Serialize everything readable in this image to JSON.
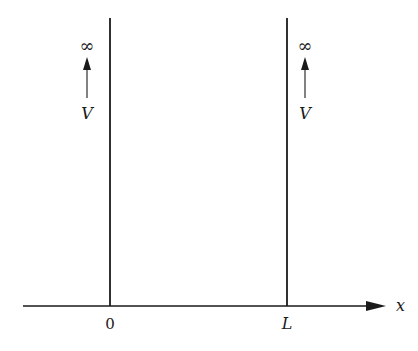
{
  "diagram": {
    "axis": {
      "label": "x"
    },
    "walls": [
      {
        "position_label": "0",
        "potential_label": "V",
        "limit_label": "∞"
      },
      {
        "position_label": "L",
        "potential_label": "V",
        "limit_label": "∞"
      }
    ]
  },
  "colors": {
    "stroke": "#1a1a1a",
    "background": "#ffffff"
  }
}
